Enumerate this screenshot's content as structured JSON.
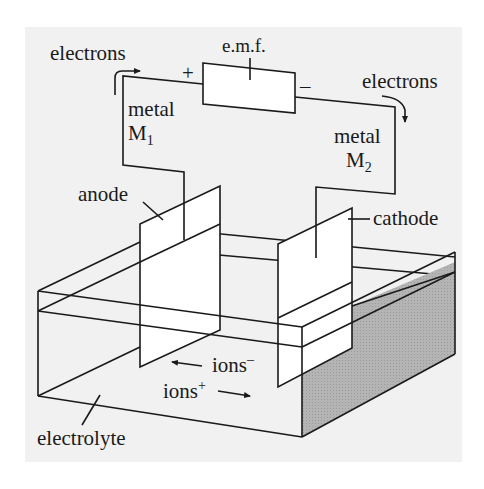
{
  "diagram": {
    "colors": {
      "background": "#ffffff",
      "panel": "#f1f1f1",
      "stroke": "#1a1a1a",
      "shaded_face": "#a9a9a9",
      "plate_fill": "#ffffff"
    },
    "labels": {
      "emf": "e.m.f.",
      "plus": "+",
      "minus": "–",
      "electrons_left": "electrons",
      "electrons_right": "electrons",
      "metal_left": "metal",
      "metal_left_symbol": "M",
      "metal_left_subscript": "1",
      "metal_right": "metal",
      "metal_right_symbol": "M",
      "metal_right_subscript": "2",
      "anode": "anode",
      "cathode": "cathode",
      "ions_negative": "ions",
      "ions_negative_sup": "–",
      "ions_positive": "ions",
      "ions_positive_sup": "+",
      "electrolyte": "electrolyte"
    },
    "flows": [
      {
        "name": "electron-flow-left",
        "direction": "out of metal M1 toward + terminal"
      },
      {
        "name": "electron-flow-right",
        "direction": "from – terminal into metal M2"
      },
      {
        "name": "negative-ion-flow",
        "direction": "toward anode (left)"
      },
      {
        "name": "positive-ion-flow",
        "direction": "toward cathode (right)"
      }
    ]
  }
}
